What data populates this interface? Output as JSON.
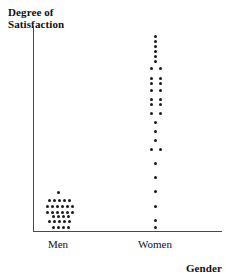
{
  "chart_data": {
    "type": "scatter",
    "plot_style": "dotplot",
    "title": "",
    "ylabel": "Degree of\nSatisfaction",
    "xlabel": "Gender",
    "categories": [
      "Men",
      "Women"
    ],
    "grid": false,
    "legend": null,
    "axis": {
      "x_axis_visible": true,
      "y_axis_visible": true,
      "y_tick_labels": [],
      "x_tick_labels": [
        "Men",
        "Women"
      ]
    },
    "series": [
      {
        "name": "Men",
        "category": "Men",
        "count": 31,
        "spread": "low-end cluster",
        "stack_rows": [
          {
            "level": 7,
            "count": 1
          },
          {
            "level": 6,
            "count": 5
          },
          {
            "level": 5,
            "count": 6
          },
          {
            "level": 4,
            "count": 6
          },
          {
            "level": 3,
            "count": 4
          },
          {
            "level": 2,
            "count": 5
          },
          {
            "level": 1,
            "count": 4
          }
        ],
        "dots": [
          {
            "x": 58,
            "y": 192
          },
          {
            "x": 49,
            "y": 200
          },
          {
            "x": 54,
            "y": 200
          },
          {
            "x": 59,
            "y": 200
          },
          {
            "x": 64,
            "y": 200
          },
          {
            "x": 69,
            "y": 200
          },
          {
            "x": 47,
            "y": 206
          },
          {
            "x": 52,
            "y": 206
          },
          {
            "x": 57,
            "y": 206
          },
          {
            "x": 62,
            "y": 206
          },
          {
            "x": 67,
            "y": 206
          },
          {
            "x": 72,
            "y": 206
          },
          {
            "x": 47,
            "y": 212
          },
          {
            "x": 52,
            "y": 212
          },
          {
            "x": 57,
            "y": 212
          },
          {
            "x": 62,
            "y": 212
          },
          {
            "x": 67,
            "y": 212
          },
          {
            "x": 72,
            "y": 212
          },
          {
            "x": 53,
            "y": 216
          },
          {
            "x": 58,
            "y": 216
          },
          {
            "x": 63,
            "y": 216
          },
          {
            "x": 68,
            "y": 216
          },
          {
            "x": 49,
            "y": 221
          },
          {
            "x": 54,
            "y": 221
          },
          {
            "x": 59,
            "y": 221
          },
          {
            "x": 64,
            "y": 221
          },
          {
            "x": 69,
            "y": 221
          },
          {
            "x": 53,
            "y": 227
          },
          {
            "x": 58,
            "y": 227
          },
          {
            "x": 63,
            "y": 227
          },
          {
            "x": 68,
            "y": 227
          }
        ]
      },
      {
        "name": "Women",
        "category": "Women",
        "count": 32,
        "spread": "full range, concentrated high",
        "dots": [
          {
            "x": 155,
            "y": 36
          },
          {
            "x": 155,
            "y": 41
          },
          {
            "x": 155,
            "y": 46
          },
          {
            "x": 155,
            "y": 51
          },
          {
            "x": 155,
            "y": 56
          },
          {
            "x": 155,
            "y": 61
          },
          {
            "x": 151,
            "y": 68
          },
          {
            "x": 160,
            "y": 68
          },
          {
            "x": 151,
            "y": 78
          },
          {
            "x": 160,
            "y": 78
          },
          {
            "x": 151,
            "y": 83
          },
          {
            "x": 160,
            "y": 83
          },
          {
            "x": 151,
            "y": 90
          },
          {
            "x": 160,
            "y": 90
          },
          {
            "x": 151,
            "y": 99
          },
          {
            "x": 160,
            "y": 99
          },
          {
            "x": 151,
            "y": 104
          },
          {
            "x": 160,
            "y": 104
          },
          {
            "x": 151,
            "y": 113
          },
          {
            "x": 160,
            "y": 113
          },
          {
            "x": 155,
            "y": 122
          },
          {
            "x": 155,
            "y": 131
          },
          {
            "x": 155,
            "y": 140
          },
          {
            "x": 151,
            "y": 149
          },
          {
            "x": 160,
            "y": 149
          },
          {
            "x": 155,
            "y": 163
          },
          {
            "x": 155,
            "y": 177
          },
          {
            "x": 155,
            "y": 191
          },
          {
            "x": 155,
            "y": 206
          },
          {
            "x": 155,
            "y": 220
          },
          {
            "x": 155,
            "y": 227
          }
        ]
      }
    ]
  },
  "style": {
    "dot_color": "#1a1a1a",
    "axis_color": "#4a4a4a",
    "text_color": "#111111",
    "background": "#ffffff"
  }
}
